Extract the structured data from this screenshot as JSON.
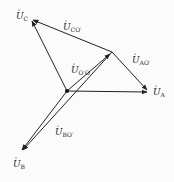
{
  "diagram": {
    "type": "phasor-diagram",
    "stroke_color": "#222222",
    "background": "#fbfbfb",
    "points": {
      "O_prime": {
        "x": 67,
        "y": 91
      },
      "O": {
        "x": 112,
        "y": 52
      },
      "A": {
        "x": 149,
        "y": 92
      },
      "B": {
        "x": 21,
        "y": 152
      },
      "C": {
        "x": 31,
        "y": 19
      }
    },
    "labels": {
      "UC": {
        "base": "U",
        "sub": "C"
      },
      "UCO": {
        "base": "U",
        "sub": "CO′"
      },
      "UOO": {
        "base": "U",
        "sub": "O′O"
      },
      "UAO": {
        "base": "U",
        "sub": "AO′"
      },
      "UA": {
        "base": "U",
        "sub": "A"
      },
      "UBO": {
        "base": "U",
        "sub": "BO′"
      },
      "UB": {
        "base": "U",
        "sub": "B"
      }
    },
    "dot_symbol": "·"
  }
}
